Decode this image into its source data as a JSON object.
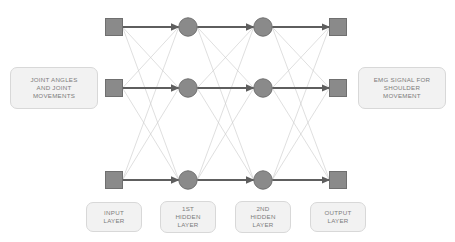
{
  "figure": {
    "type": "neural-network-diagram",
    "background_color": "#ffffff",
    "node_color": "#8a8a8a",
    "node_border_color": "#6f6f6f",
    "strong_link_color": "#5e5e5e",
    "weak_link_color": "#c9c9c9",
    "label_fill": "#f2f2f2",
    "label_border": "#d8d8d8",
    "label_text_color": "#7c7c7c"
  },
  "side_labels": {
    "left": {
      "name": "input-description",
      "lines": [
        "JOINT ANGLES",
        "AND JOINT",
        "MOVEMENTS"
      ]
    },
    "right": {
      "name": "output-description",
      "lines": [
        "EMG SIGNAL FOR",
        "SHOULDER",
        "MOVEMENT"
      ]
    }
  },
  "layers": [
    {
      "id": "input",
      "label_lines": [
        "INPUT",
        "LAYER"
      ],
      "node_shape": "square",
      "node_count": 3,
      "x": 114
    },
    {
      "id": "hidden1",
      "label_lines": [
        "1ST",
        "HIDDEN",
        "LAYER"
      ],
      "node_shape": "circle",
      "node_count": 3,
      "x": 188
    },
    {
      "id": "hidden2",
      "label_lines": [
        "2ND",
        "HIDDEN",
        "LAYER"
      ],
      "node_shape": "circle",
      "node_count": 3,
      "x": 263
    },
    {
      "id": "output",
      "label_lines": [
        "OUTPUT",
        "LAYER"
      ],
      "node_shape": "square",
      "node_count": 3,
      "x": 338
    }
  ],
  "rows_y": [
    27,
    88,
    180
  ]
}
